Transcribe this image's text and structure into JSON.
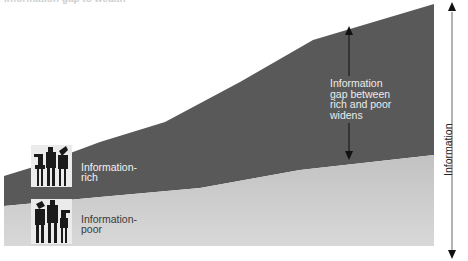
{
  "title": "Information gap to wealth",
  "colors": {
    "information_rich_band": "#5a5a5a",
    "information_poor_band_top": "#c4c4c4",
    "information_poor_band_bottom": "#d6d6d6",
    "arrow": "#111111",
    "icon_bg": "#ececec",
    "icon_figures": "#1a1a1a"
  },
  "bands": {
    "rich": {
      "label": "Information-\nrich",
      "label_line1": "Information-",
      "label_line2": "rich"
    },
    "poor": {
      "label": "Information-\npoor",
      "label_line1": "Information-",
      "label_line2": "poor"
    }
  },
  "gap_annotation": {
    "line1": "Information",
    "line2": "gap between",
    "line3": "rich and poor",
    "line4": "widens"
  },
  "axis": {
    "label": "Information",
    "direction": "vertical double-headed arrow"
  },
  "icons": {
    "rich_group": "people-group-icon",
    "poor_group": "people-group-icon"
  }
}
